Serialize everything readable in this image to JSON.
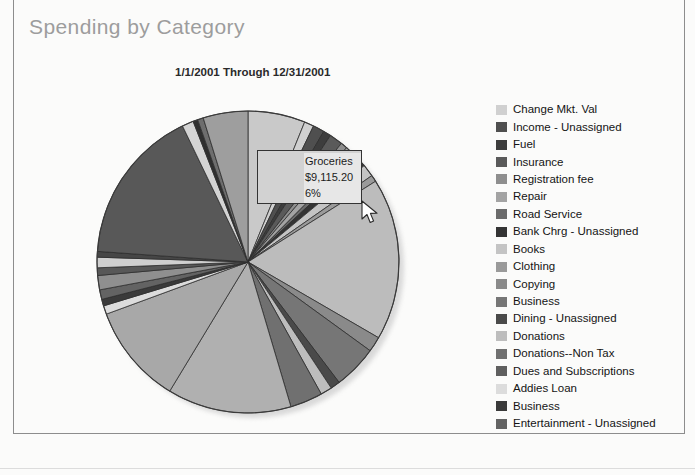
{
  "report": {
    "title": "Spending by Category",
    "date_range": "1/1/2001 Through 12/31/2001"
  },
  "tooltip": {
    "category": "Groceries",
    "amount": "$9,115.20",
    "percent": "6%",
    "background_color": "#d2d2d2",
    "border_color": "#333333"
  },
  "cursor": {
    "icon": "mouse-pointer-icon",
    "x": 360,
    "y": 200
  },
  "legend": {
    "items": [
      {
        "label": "Change Mkt. Val",
        "color": "#d0d0d0"
      },
      {
        "label": "Income - Unassigned",
        "color": "#4f4f4f"
      },
      {
        "label": "Fuel",
        "color": "#3d3d3d"
      },
      {
        "label": "Insurance",
        "color": "#5a5a5a"
      },
      {
        "label": "Registration fee",
        "color": "#8e8e8e"
      },
      {
        "label": "Repair",
        "color": "#a3a3a3"
      },
      {
        "label": "Road Service",
        "color": "#6b6b6b"
      },
      {
        "label": "Bank Chrg - Unassigned",
        "color": "#343434"
      },
      {
        "label": "Books",
        "color": "#c4c4c4"
      },
      {
        "label": "Clothing",
        "color": "#9a9a9a"
      },
      {
        "label": "Copying",
        "color": "#8a8a8a"
      },
      {
        "label": "Business",
        "color": "#767676"
      },
      {
        "label": "Dining - Unassigned",
        "color": "#4a4a4a"
      },
      {
        "label": "Donations",
        "color": "#bdbdbd"
      },
      {
        "label": "Donations--Non Tax",
        "color": "#707070"
      },
      {
        "label": "Dues and Subscriptions",
        "color": "#5f5f5f"
      },
      {
        "label": "Addies Loan",
        "color": "#dcdcdc"
      },
      {
        "label": "Business",
        "color": "#3a3a3a"
      },
      {
        "label": "Entertainment - Unassigned",
        "color": "#636363"
      }
    ]
  },
  "chart_data": {
    "type": "pie",
    "title": "Spending by Category",
    "subtitle": "1/1/2001 Through 12/31/2001",
    "legend_position": "right",
    "grid": false,
    "start_angle_deg": -90,
    "direction": "clockwise",
    "center": {
      "cx": 158,
      "cy": 158
    },
    "radius": 151,
    "highlighted_slice": "Groceries",
    "highlighted_value": "$9,115.20",
    "highlighted_percent": 6,
    "slices": [
      {
        "label": "Groceries",
        "percent": 6.0,
        "color": "#c9c9c9"
      },
      {
        "label": "Change Mkt. Val",
        "percent": 1.0,
        "color": "#d0d0d0"
      },
      {
        "label": "Income - Unassigned",
        "percent": 1.2,
        "color": "#4f4f4f"
      },
      {
        "label": "Fuel",
        "percent": 0.8,
        "color": "#3d3d3d"
      },
      {
        "label": "Insurance",
        "percent": 1.4,
        "color": "#5a5a5a"
      },
      {
        "label": "Registration fee",
        "percent": 0.7,
        "color": "#8e8e8e"
      },
      {
        "label": "Repair",
        "percent": 1.1,
        "color": "#a3a3a3"
      },
      {
        "label": "Road Service",
        "percent": 0.6,
        "color": "#6b6b6b"
      },
      {
        "label": "Bank Chrg - Unassigned",
        "percent": 0.9,
        "color": "#343434"
      },
      {
        "label": "Books",
        "percent": 1.3,
        "color": "#c4c4c4"
      },
      {
        "label": "Clothing",
        "percent": 0.7,
        "color": "#9a9a9a"
      },
      {
        "label": "Utilities",
        "percent": 17.0,
        "color": "#bcbcbc"
      },
      {
        "label": "Copying",
        "percent": 1.6,
        "color": "#8a8a8a"
      },
      {
        "label": "Business",
        "percent": 4.6,
        "color": "#767676"
      },
      {
        "label": "Dining - Unassigned",
        "percent": 1.0,
        "color": "#4a4a4a"
      },
      {
        "label": "Donations",
        "percent": 1.2,
        "color": "#bdbdbd"
      },
      {
        "label": "Donations--Non Tax",
        "percent": 3.4,
        "color": "#707070"
      },
      {
        "label": "Household",
        "percent": 13.0,
        "color": "#b0b0b0"
      },
      {
        "label": "Dues and Subscriptions",
        "percent": 10.5,
        "color": "#a8a8a8"
      },
      {
        "label": "Addies Loan",
        "percent": 0.9,
        "color": "#dcdcdc"
      },
      {
        "label": "Business",
        "percent": 0.7,
        "color": "#3a3a3a"
      },
      {
        "label": "Entertainment - Unassigned",
        "percent": 1.0,
        "color": "#636363"
      },
      {
        "label": "Mortgage",
        "percent": 1.5,
        "color": "#8f8f8f"
      },
      {
        "label": "Taxes",
        "percent": 0.8,
        "color": "#585858"
      },
      {
        "label": "Medical",
        "percent": 1.1,
        "color": "#cfcfcf"
      },
      {
        "label": "Travel",
        "percent": 0.6,
        "color": "#464646"
      },
      {
        "label": "Gifts",
        "percent": 16.4,
        "color": "#585858"
      },
      {
        "label": "Auto Loan",
        "percent": 1.2,
        "color": "#d4d4d4"
      },
      {
        "label": "Childcare",
        "percent": 0.5,
        "color": "#2f2f2f"
      },
      {
        "label": "Education",
        "percent": 0.6,
        "color": "#6e6e6e"
      },
      {
        "label": "Misc",
        "percent": 4.7,
        "color": "#9e9e9e"
      }
    ]
  }
}
